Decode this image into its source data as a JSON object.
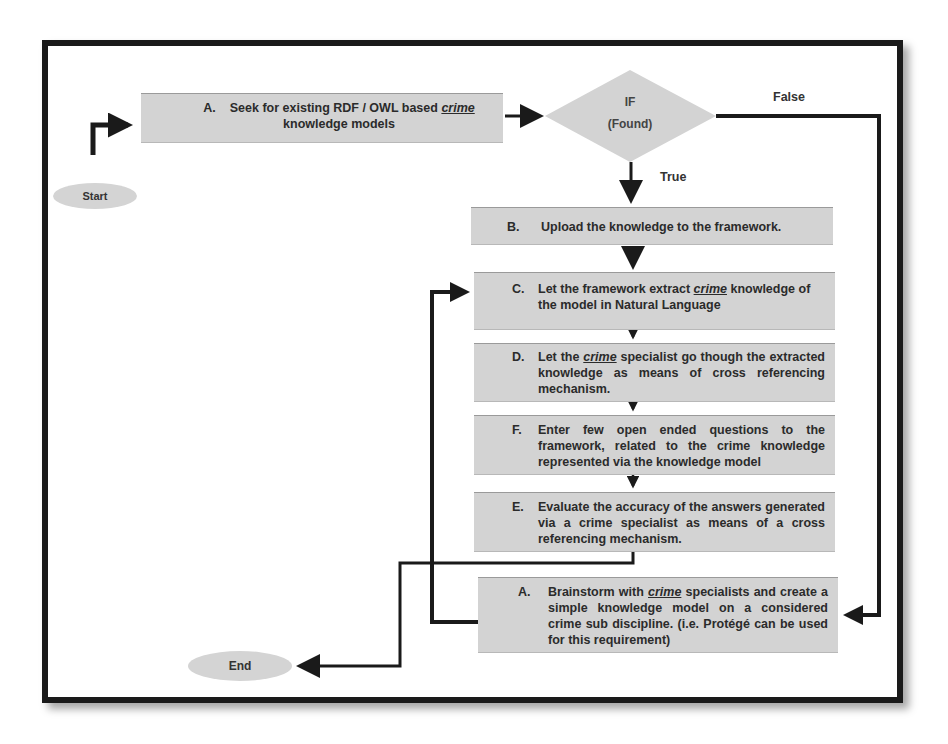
{
  "diagram": {
    "type": "flowchart",
    "start": {
      "label": "Start"
    },
    "end": {
      "label": "End"
    },
    "decision": {
      "line1": "IF",
      "line2": "(Found)",
      "true_label": "True",
      "false_label": "False"
    },
    "steps": [
      {
        "id": "seek",
        "letter": "A.",
        "pre": "Seek for existing RDF / OWL based ",
        "emph": "crime",
        "post": " knowledge models"
      },
      {
        "id": "upload",
        "letter": "B.",
        "text": "Upload the knowledge to the framework."
      },
      {
        "id": "extract",
        "letter": "C.",
        "pre": "Let  the framework extract ",
        "emph": "crime",
        "post": " knowledge of the model in Natural Language"
      },
      {
        "id": "specialist",
        "letter": "D.",
        "pre": "Let the ",
        "emph": "crime",
        "post": " specialist go though the extracted knowledge as means of cross referencing mechanism."
      },
      {
        "id": "questions",
        "letter": "F.",
        "text": "Enter few open ended questions to the framework, related to the crime knowledge represented via the knowledge model"
      },
      {
        "id": "evaluate",
        "letter": "E.",
        "text": "Evaluate the accuracy of the answers generated via a crime specialist as means of a cross referencing mechanism."
      },
      {
        "id": "brainstorm",
        "letter": "A.",
        "pre": "Brainstorm with ",
        "emph": "crime",
        "post": " specialists and create a simple knowledge model on a considered crime sub discipline. (i.e. Protégé can be used for this requirement)"
      }
    ],
    "colors": {
      "box_fill": "#d3d3d3",
      "line": "#1a1a1a",
      "text": "#2b2b2b"
    }
  }
}
